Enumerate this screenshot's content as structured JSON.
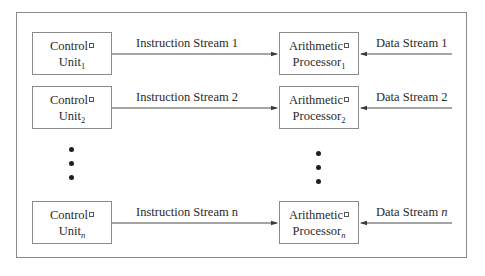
{
  "diagram": {
    "type": "MIMD-style parallel streams",
    "rows": [
      {
        "control_unit": {
          "line1": "Control",
          "line2": "Unit",
          "subscript": "1"
        },
        "instruction_stream": "Instruction Stream 1",
        "processor": {
          "line1": "Arithmetic",
          "line2": "Processor",
          "subscript": "1"
        },
        "data_stream": "Data Stream 1"
      },
      {
        "control_unit": {
          "line1": "Control",
          "line2": "Unit",
          "subscript": "2"
        },
        "instruction_stream": "Instruction Stream 2",
        "processor": {
          "line1": "Arithmetic",
          "line2": "Processor",
          "subscript": "2"
        },
        "data_stream": "Data Stream 2"
      },
      {
        "control_unit": {
          "line1": "Control",
          "line2": "Unit",
          "subscript": "n"
        },
        "instruction_stream": "Instruction Stream n",
        "processor": {
          "line1": "Arithmetic",
          "line2": "Processor",
          "subscript": "n"
        },
        "data_stream_prefix": "Data Stream ",
        "data_stream_var": "n"
      }
    ],
    "ellipsis": "vertical dots",
    "colors": {
      "line": "#4a4a4a",
      "box_border": "#8a8a8a",
      "text": "#2a2a2a"
    }
  }
}
